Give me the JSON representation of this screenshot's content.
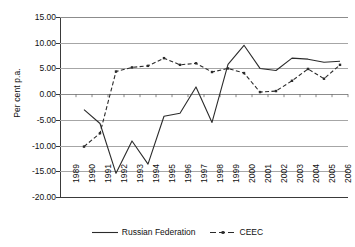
{
  "chart_data": {
    "type": "line",
    "title": "",
    "xlabel": "",
    "ylabel": "Per cent p.a.",
    "ylim": [
      -20.0,
      15.0
    ],
    "ytick_step": 5.0,
    "ytick_labels": [
      "15.00",
      "10.00",
      "5.00",
      "0.00",
      "-5.00",
      "-10.00",
      "-15.00",
      "-20.00"
    ],
    "ytick_values": [
      15.0,
      10.0,
      5.0,
      0.0,
      -5.0,
      -10.0,
      -15.0,
      -20.0
    ],
    "grid": "horizontal",
    "legend_position": "bottom-center",
    "categories": [
      "1989",
      "1990",
      "1991",
      "1992",
      "1993",
      "1994",
      "1995",
      "1996",
      "1997",
      "1998",
      "1999",
      "2000",
      "2001",
      "2002",
      "2003",
      "2004",
      "2005",
      "2006"
    ],
    "x": [
      1989,
      1990,
      1991,
      1992,
      1993,
      1994,
      1995,
      1996,
      1997,
      1998,
      1999,
      2000,
      2001,
      2002,
      2003,
      2004,
      2005,
      2006
    ],
    "series": [
      {
        "name": "Russian Federation",
        "style": "solid",
        "marker": "none",
        "color": "#2b2b2b",
        "values": [
          null,
          -3.0,
          -5.7,
          -15.4,
          -9.1,
          -13.6,
          -4.3,
          -3.7,
          1.4,
          -5.5,
          5.8,
          9.5,
          5.0,
          4.6,
          7.0,
          6.8,
          6.2,
          6.4
        ]
      },
      {
        "name": "CEEC",
        "style": "dashed",
        "marker": "square",
        "color": "#2b2b2b",
        "values": [
          null,
          -10.2,
          -7.6,
          4.4,
          5.2,
          5.5,
          7.0,
          5.7,
          6.0,
          4.3,
          5.0,
          4.1,
          0.4,
          0.6,
          2.6,
          4.9,
          3.0,
          5.7
        ]
      }
    ]
  },
  "legend": {
    "entries": [
      {
        "label": "Russian Federation"
      },
      {
        "label": "CEEC"
      }
    ]
  }
}
